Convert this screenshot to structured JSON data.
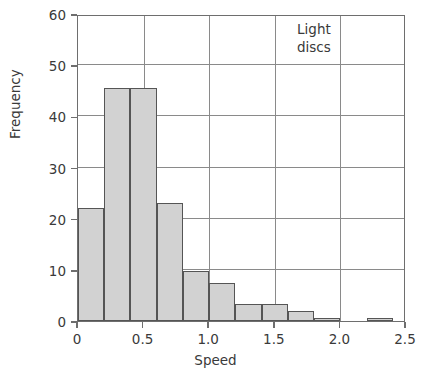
{
  "chart_data": {
    "type": "bar",
    "title": "",
    "subtitle": "",
    "xlabel": "Speed",
    "ylabel": "Frequency",
    "annotation": {
      "line1": "Light",
      "line2": "discs"
    },
    "xlim": [
      0,
      2.5
    ],
    "ylim": [
      0,
      60
    ],
    "xticks": [
      0,
      0.5,
      1.0,
      1.5,
      2.0,
      2.5
    ],
    "xtick_labels": [
      "0",
      "0.5",
      "1.0",
      "1.5",
      "2.0",
      "2.5"
    ],
    "yticks": [
      0,
      10,
      20,
      30,
      40,
      50,
      60
    ],
    "ytick_labels": [
      "0",
      "10",
      "20",
      "30",
      "40",
      "50",
      "60"
    ],
    "grid": "both",
    "legend": "none",
    "bin_width": 0.2,
    "bin_edges": [
      0.0,
      0.2,
      0.4,
      0.6,
      0.8,
      1.0,
      1.2,
      1.4,
      1.6,
      1.8,
      2.0,
      2.2,
      2.4
    ],
    "categories": [
      "0.0-0.2",
      "0.2-0.4",
      "0.4-0.6",
      "0.6-0.8",
      "0.8-1.0",
      "1.0-1.2",
      "1.2-1.4",
      "1.4-1.6",
      "1.6-1.8",
      "1.8-2.0",
      "2.0-2.2",
      "2.2-2.4"
    ],
    "values": [
      22,
      45.5,
      45.5,
      23,
      9.8,
      7.5,
      3.4,
      3.4,
      2,
      0.5,
      0,
      0.5
    ],
    "colors": {
      "bar_fill": "#d2d2d2",
      "bar_edge": "#555555",
      "grid": "#8a8a8a",
      "axis": "#6e6e6e",
      "text": "#3a3a3a",
      "background": "#ffffff"
    }
  }
}
